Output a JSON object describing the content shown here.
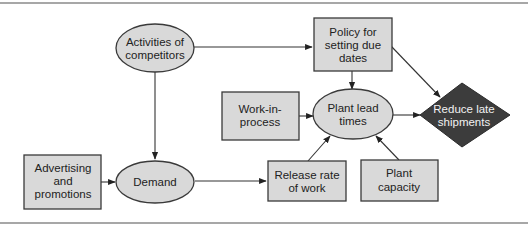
{
  "diagram": {
    "type": "influence-diagram",
    "nodes": [
      {
        "id": "competitors",
        "shape": "ellipse",
        "lines": [
          "Activities of",
          "competitors"
        ]
      },
      {
        "id": "policy",
        "shape": "rectangle",
        "lines": [
          "Policy for",
          "setting due",
          "dates"
        ]
      },
      {
        "id": "wip",
        "shape": "rectangle",
        "lines": [
          "Work-in-",
          "process"
        ]
      },
      {
        "id": "leadtimes",
        "shape": "ellipse",
        "lines": [
          "Plant lead",
          "times"
        ]
      },
      {
        "id": "reduce",
        "shape": "diamond",
        "lines": [
          "Reduce late",
          "shipments"
        ]
      },
      {
        "id": "advertising",
        "shape": "rectangle",
        "lines": [
          "Advertising",
          "and",
          "promotions"
        ]
      },
      {
        "id": "demand",
        "shape": "ellipse",
        "lines": [
          "Demand"
        ]
      },
      {
        "id": "release",
        "shape": "rectangle",
        "lines": [
          "Release rate",
          "of work"
        ]
      },
      {
        "id": "capacity",
        "shape": "rectangle",
        "lines": [
          "Plant",
          "capacity"
        ]
      }
    ],
    "edges": [
      {
        "from": "competitors",
        "to": "policy"
      },
      {
        "from": "competitors",
        "to": "demand"
      },
      {
        "from": "policy",
        "to": "leadtimes"
      },
      {
        "from": "policy",
        "to": "reduce"
      },
      {
        "from": "wip",
        "to": "leadtimes"
      },
      {
        "from": "leadtimes",
        "to": "reduce"
      },
      {
        "from": "advertising",
        "to": "demand"
      },
      {
        "from": "demand",
        "to": "release"
      },
      {
        "from": "release",
        "to": "leadtimes"
      },
      {
        "from": "capacity",
        "to": "leadtimes"
      }
    ],
    "colors": {
      "node_fill": "#d9d9d9",
      "decision_fill": "#3c3c3c",
      "stroke": "#333333"
    }
  }
}
